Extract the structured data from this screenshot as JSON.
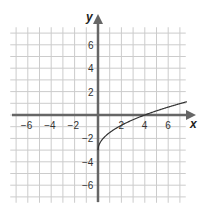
{
  "chart_data": {
    "type": "line",
    "title": "",
    "xlabel": "x",
    "ylabel": "y",
    "xlim": [
      -7.5,
      7.5
    ],
    "ylim": [
      -7.5,
      7.5
    ],
    "grid": true,
    "x_tick_labels": [
      "-6",
      "-4",
      "-2",
      "2",
      "4",
      "6"
    ],
    "y_tick_labels": [
      "6",
      "4",
      "2",
      "-2",
      "-4",
      "-6"
    ],
    "x_ticks": [
      -6,
      -4,
      -2,
      2,
      4,
      6
    ],
    "y_ticks": [
      6,
      4,
      2,
      -2,
      -4,
      -6
    ],
    "series": [
      {
        "name": "curve",
        "description": "square-root curve starting at (0,-3), crossing x-axis at (4,0)",
        "points": [
          [
            0,
            -3
          ],
          [
            0.25,
            -2.25
          ],
          [
            1,
            -1.5
          ],
          [
            2,
            -0.88
          ],
          [
            3,
            -0.4
          ],
          [
            4,
            0
          ],
          [
            5,
            0.35
          ],
          [
            6,
            0.67
          ],
          [
            7,
            0.97
          ],
          [
            7.5,
            1.1
          ]
        ]
      }
    ],
    "colors": {
      "grid": "#cccccc",
      "axis": "#666666",
      "curve": "#333333"
    }
  }
}
